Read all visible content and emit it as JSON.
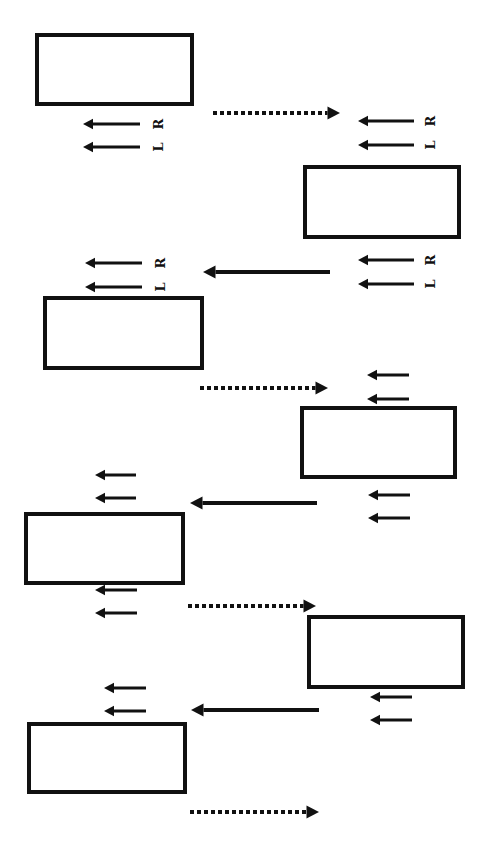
{
  "diagram": {
    "type": "alternating-step-sequence",
    "colors": {
      "stroke": "#111111",
      "background": "#ffffff"
    },
    "boxes": [
      {
        "id": "box-1",
        "x": 37,
        "y": 35,
        "w": 155,
        "h": 69
      },
      {
        "id": "box-2",
        "x": 305,
        "y": 167,
        "w": 154,
        "h": 70
      },
      {
        "id": "box-3",
        "x": 45,
        "y": 298,
        "w": 157,
        "h": 70
      },
      {
        "id": "box-4",
        "x": 302,
        "y": 408,
        "w": 153,
        "h": 69
      },
      {
        "id": "box-5",
        "x": 26,
        "y": 514,
        "w": 157,
        "h": 69
      },
      {
        "id": "box-6",
        "x": 309,
        "y": 617,
        "w": 154,
        "h": 70
      },
      {
        "id": "box-7",
        "x": 29,
        "y": 724,
        "w": 156,
        "h": 68
      }
    ],
    "transitions": [
      {
        "id": "dotted-1",
        "style": "dotted",
        "direction": "right",
        "x1": 213,
        "x2": 340,
        "y": 113
      },
      {
        "id": "solid-1",
        "style": "solid",
        "direction": "left",
        "x1": 330,
        "x2": 203,
        "y": 272
      },
      {
        "id": "dotted-2",
        "style": "dotted",
        "direction": "right",
        "x1": 200,
        "x2": 328,
        "y": 388
      },
      {
        "id": "solid-2",
        "style": "solid",
        "direction": "left",
        "x1": 317,
        "x2": 190,
        "y": 503
      },
      {
        "id": "dotted-3",
        "style": "dotted",
        "direction": "right",
        "x1": 188,
        "x2": 316,
        "y": 606
      },
      {
        "id": "solid-3",
        "style": "solid",
        "direction": "left",
        "x1": 319,
        "x2": 191,
        "y": 710
      },
      {
        "id": "dotted-4",
        "style": "dotted",
        "direction": "right",
        "x1": 190,
        "x2": 319,
        "y": 812
      }
    ],
    "arrow_pairs": [
      {
        "id": "pair-1",
        "x1": 140,
        "x2": 83,
        "y_top": 124,
        "y_bottom": 147,
        "labels": {
          "top": "R",
          "bottom": "L"
        },
        "label_x": 158
      },
      {
        "id": "pair-2",
        "x1": 414,
        "x2": 358,
        "y_top": 121,
        "y_bottom": 145,
        "labels": {
          "top": "R",
          "bottom": "L"
        },
        "label_x": 430
      },
      {
        "id": "pair-3",
        "x1": 142,
        "x2": 85,
        "y_top": 263,
        "y_bottom": 287,
        "labels": {
          "top": "R",
          "bottom": "L"
        },
        "label_x": 160
      },
      {
        "id": "pair-4",
        "x1": 414,
        "x2": 358,
        "y_top": 260,
        "y_bottom": 284,
        "labels": {
          "top": "R",
          "bottom": "L"
        },
        "label_x": 430
      },
      {
        "id": "pair-5",
        "x1": 409,
        "x2": 367,
        "y_top": 375,
        "y_bottom": 399,
        "labels": null
      },
      {
        "id": "pair-6",
        "x1": 136,
        "x2": 95,
        "y_top": 475,
        "y_bottom": 498,
        "labels": null
      },
      {
        "id": "pair-7",
        "x1": 410,
        "x2": 368,
        "y_top": 495,
        "y_bottom": 518,
        "labels": null
      },
      {
        "id": "pair-8",
        "x1": 137,
        "x2": 95,
        "y_top": 590,
        "y_bottom": 613,
        "labels": null
      },
      {
        "id": "pair-9",
        "x1": 146,
        "x2": 104,
        "y_top": 688,
        "y_bottom": 711,
        "labels": null
      },
      {
        "id": "pair-10",
        "x1": 412,
        "x2": 370,
        "y_top": 697,
        "y_bottom": 720,
        "labels": null
      }
    ]
  }
}
